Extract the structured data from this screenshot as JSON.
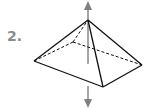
{
  "problem": {
    "number_label": "2."
  },
  "figure": {
    "name": "square pyramid with vertical rotation axis",
    "colors": {
      "edge": "#111111",
      "axis": "#808080",
      "label": "#8a8a8a"
    },
    "vertices": {
      "apex": [
        88,
        20
      ],
      "left": [
        34,
        61
      ],
      "back": [
        73,
        42
      ],
      "right": [
        142,
        65
      ],
      "front": [
        103,
        87
      ]
    },
    "axis": {
      "top_arrow_tip": [
        88,
        1
      ],
      "bottom_arrow_tip": [
        88,
        108
      ]
    }
  }
}
